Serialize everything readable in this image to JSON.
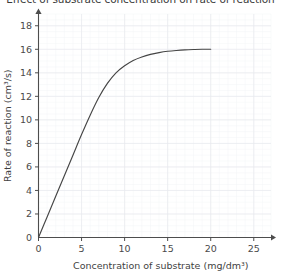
{
  "chart_data": {
    "type": "line",
    "title": "Effect of substrate concentration on rate of reaction",
    "xlabel": "Concentration of substrate (mg/dm³)",
    "ylabel": "Rate of reaction (cm³/s)",
    "xlim": [
      0,
      27
    ],
    "ylim": [
      0,
      19
    ],
    "grid": true,
    "legend": "none",
    "x_ticks": [
      0,
      5,
      10,
      15,
      20,
      25
    ],
    "x_tick_labels": [
      "0",
      "5",
      "10",
      "15",
      "20",
      "25"
    ],
    "y_ticks": [
      0,
      2,
      4,
      6,
      8,
      10,
      12,
      14,
      16,
      18
    ],
    "y_tick_labels": [
      "0",
      "2",
      "4",
      "6",
      "8",
      "10",
      "12",
      "14",
      "16",
      "18"
    ],
    "x_minor_step": 1,
    "y_minor_step": 0.5,
    "axes_have_arrows": true,
    "series": [
      {
        "name": "Rate of reaction",
        "color": "#454545",
        "x": [
          0,
          1,
          2,
          3,
          4,
          5,
          6,
          7,
          8,
          9,
          10,
          11,
          12,
          13,
          14,
          15,
          16,
          17,
          18,
          19,
          20
        ],
        "values": [
          0,
          1.75,
          3.5,
          5.25,
          7.0,
          8.75,
          10.4,
          11.9,
          13.1,
          14.0,
          14.6,
          15.05,
          15.35,
          15.57,
          15.72,
          15.83,
          15.9,
          15.95,
          15.98,
          16.0,
          16.0
        ]
      }
    ],
    "plateau_value": 16,
    "plateau_starts_at_x": 18
  },
  "colors": {
    "axis": "#4d4d4d",
    "curve": "#454545",
    "grid_major": "#e8eaee",
    "grid_minor": "#f2f4f7",
    "background": "#ffffff",
    "text": "#3f3f3f"
  }
}
